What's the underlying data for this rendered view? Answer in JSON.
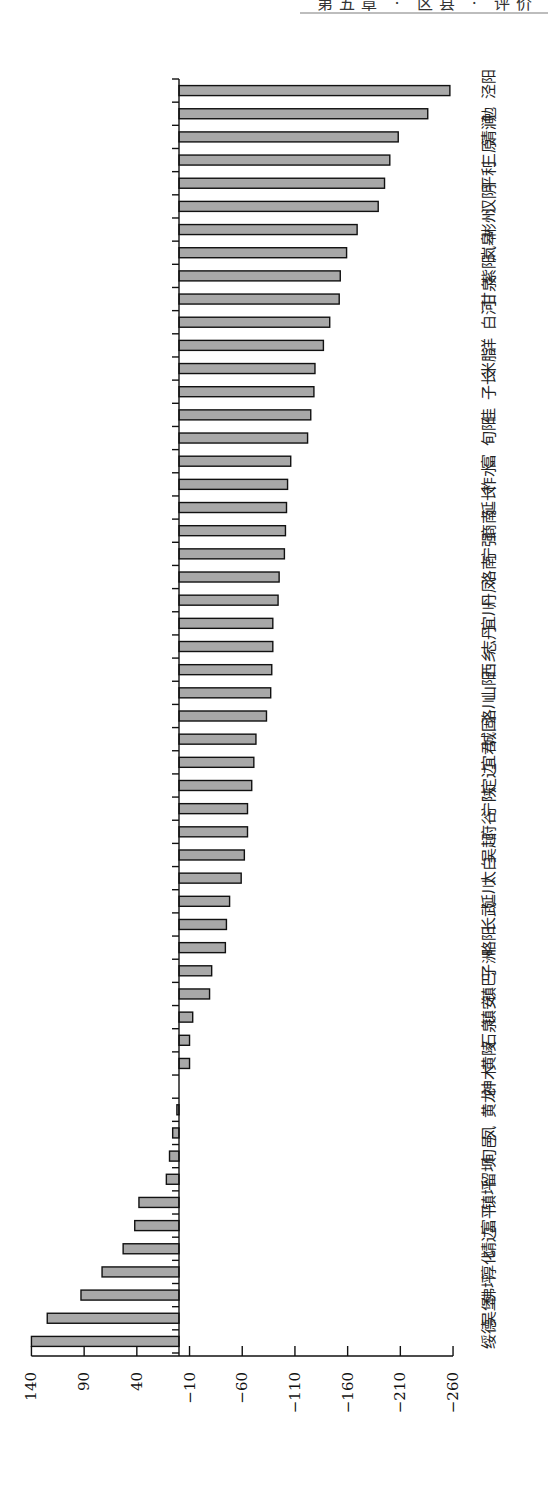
{
  "header": {
    "text": "第五章 · 区县 · 评价"
  },
  "chart_data": {
    "type": "bar",
    "orientation": "horizontal-rotated-90",
    "title": "",
    "xlabel": "",
    "ylabel": "",
    "ylim": [
      -260,
      140
    ],
    "ticks": [
      140,
      90,
      40,
      -10,
      -60,
      -110,
      -160,
      -210,
      -260
    ],
    "grid": false,
    "legend": null,
    "categories": [
      "绥德县",
      "吴堡县",
      "佛坪县",
      "淳化县",
      "靖边县",
      "富平县",
      "镇坪县",
      "留坝县",
      "旬邑县",
      "凤县",
      "黄龙县",
      "神木市",
      "黄陵县",
      "石泉县",
      "镇安县",
      "镇巴县",
      "子洲县",
      "略阳县",
      "长武县",
      "延川县",
      "太白县",
      "吴起县",
      "府谷县",
      "宁陕县",
      "定边县",
      "宜君县",
      "城固县",
      "洛川县",
      "山阳县",
      "西乡县",
      "志丹县",
      "宜川县",
      "丹凤县",
      "洛南县",
      "宁强县",
      "商南县",
      "延长县",
      "柞水县",
      "富县",
      "旬阳市",
      "佳县",
      "子长市",
      "米脂县",
      "洋县",
      "白河县",
      "甘泉县",
      "紫阳县",
      "岚皋县",
      "彬州市",
      "汉阴县",
      "平利县",
      "三原县",
      "清涧县",
      "勉县",
      "泾阳县"
    ],
    "values": [
      140,
      125,
      93,
      73,
      53,
      42,
      38,
      12,
      9,
      6,
      2,
      0,
      -10,
      -10,
      -13,
      -29,
      -31,
      -44,
      -45,
      -48,
      -59,
      -62,
      -65,
      -65,
      -69,
      -71,
      -73,
      -83,
      -87,
      -88,
      -89,
      -89,
      -94,
      -95,
      -100,
      -101,
      -102,
      -103,
      -106,
      -122,
      -125,
      -128,
      -129,
      -137,
      -143,
      -152,
      -153,
      -159,
      -169,
      -189,
      -195,
      -200,
      -208,
      -236,
      -257
    ]
  },
  "colors": {
    "bar_fill": "#a8a8a8",
    "bar_stroke": "#111111",
    "axis": "#111111"
  }
}
